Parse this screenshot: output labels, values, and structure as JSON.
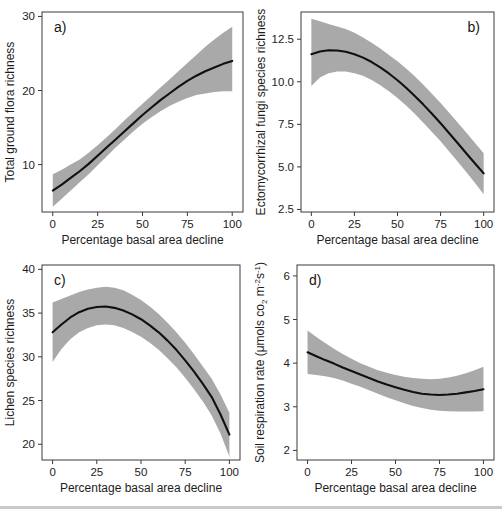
{
  "figure": {
    "background": "#ffffff",
    "band_color": "#a9a9a9",
    "line_color": "#101010",
    "axis_color": "#3a3a3a",
    "shared_xlabel": "Percentage basal area decline",
    "xticks": [
      "0",
      "25",
      "50",
      "75",
      "100"
    ]
  },
  "chart_data": [
    {
      "type": "line",
      "panel": "a",
      "tag": "a)",
      "title": "",
      "xlabel": "Percentage basal area decline",
      "ylabel": "Total ground flora richness",
      "xlim": [
        -6,
        106
      ],
      "ylim": [
        3.6,
        30.6
      ],
      "xticks": [
        0,
        25,
        50,
        75,
        100
      ],
      "xticklabels": [
        "0",
        "25",
        "50",
        "75",
        "100"
      ],
      "yticks": [
        10,
        20,
        30
      ],
      "yticklabels": [
        "10",
        "20",
        "30"
      ],
      "grid": false,
      "legend": "none",
      "x": [
        0,
        5,
        10,
        15,
        20,
        25,
        30,
        35,
        40,
        45,
        50,
        55,
        60,
        65,
        70,
        75,
        80,
        85,
        90,
        95,
        100
      ],
      "fit": [
        6.5,
        7.3,
        8.2,
        9.1,
        10.1,
        11.2,
        12.3,
        13.4,
        14.5,
        15.6,
        16.7,
        17.7,
        18.7,
        19.6,
        20.5,
        21.3,
        22.0,
        22.6,
        23.1,
        23.6,
        24.0
      ],
      "ci_lower": [
        4.3,
        5.4,
        6.5,
        7.6,
        8.7,
        9.9,
        11.1,
        12.3,
        13.4,
        14.5,
        15.5,
        16.4,
        17.2,
        17.9,
        18.5,
        19.0,
        19.4,
        19.6,
        19.8,
        19.9,
        19.9
      ],
      "ci_upper": [
        8.7,
        9.3,
        10.0,
        10.7,
        11.6,
        12.6,
        13.7,
        14.8,
        16.0,
        17.1,
        18.2,
        19.3,
        20.4,
        21.5,
        22.6,
        23.7,
        24.8,
        25.9,
        26.9,
        27.8,
        28.6
      ]
    },
    {
      "type": "line",
      "panel": "b",
      "tag": "b)",
      "title": "",
      "xlabel": "Percentage basal area decline",
      "ylabel": "Ectomycorrhizal fungi species richness",
      "xlim": [
        -6,
        106
      ],
      "ylim": [
        2.35,
        14.1
      ],
      "xticks": [
        0,
        25,
        50,
        75,
        100
      ],
      "xticklabels": [
        "0",
        "25",
        "50",
        "75",
        "100"
      ],
      "yticks": [
        2.5,
        5.0,
        7.5,
        10.0,
        12.5
      ],
      "yticklabels": [
        "2.5",
        "5.0",
        "7.5",
        "10.0",
        "12.5"
      ],
      "grid": false,
      "legend": "none",
      "x": [
        0,
        5,
        10,
        15,
        20,
        25,
        30,
        35,
        40,
        45,
        50,
        55,
        60,
        65,
        70,
        75,
        80,
        85,
        90,
        95,
        100
      ],
      "fit": [
        11.62,
        11.78,
        11.85,
        11.84,
        11.76,
        11.62,
        11.42,
        11.16,
        10.85,
        10.49,
        10.09,
        9.65,
        9.17,
        8.66,
        8.12,
        7.56,
        6.98,
        6.39,
        5.79,
        5.2,
        4.62
      ],
      "ci_lower": [
        9.75,
        10.25,
        10.5,
        10.6,
        10.6,
        10.5,
        10.35,
        10.1,
        9.8,
        9.45,
        9.05,
        8.6,
        8.12,
        7.6,
        7.05,
        6.5,
        5.9,
        5.3,
        4.68,
        4.05,
        3.4
      ],
      "ci_upper": [
        13.7,
        13.55,
        13.4,
        13.25,
        13.1,
        12.88,
        12.6,
        12.3,
        11.95,
        11.58,
        11.2,
        10.78,
        10.32,
        9.82,
        9.3,
        8.75,
        8.18,
        7.6,
        7.0,
        6.4,
        5.8
      ]
    },
    {
      "type": "line",
      "panel": "c",
      "tag": "c)",
      "title": "",
      "xlabel": "Percentage basal area decline",
      "ylabel": "Lichen species richness",
      "xlim": [
        -6,
        106
      ],
      "ylim": [
        18.2,
        40.5
      ],
      "xticks": [
        0,
        25,
        50,
        75,
        100
      ],
      "xticklabels": [
        "0",
        "25",
        "50",
        "75",
        "100"
      ],
      "yticks": [
        20,
        25,
        30,
        35,
        40
      ],
      "yticklabels": [
        "20",
        "25",
        "30",
        "35",
        "40"
      ],
      "grid": false,
      "legend": "none",
      "x": [
        0,
        5,
        10,
        15,
        20,
        25,
        30,
        35,
        40,
        45,
        50,
        55,
        60,
        65,
        70,
        75,
        80,
        85,
        90,
        95,
        100
      ],
      "fit": [
        32.8,
        33.7,
        34.5,
        35.1,
        35.5,
        35.7,
        35.75,
        35.6,
        35.3,
        34.85,
        34.3,
        33.6,
        32.8,
        31.85,
        30.8,
        29.6,
        28.3,
        26.9,
        25.4,
        23.4,
        21.1
      ],
      "ci_lower": [
        29.4,
        30.9,
        32.0,
        32.8,
        33.3,
        33.6,
        33.7,
        33.6,
        33.3,
        32.85,
        32.3,
        31.6,
        30.8,
        29.85,
        28.8,
        27.6,
        26.3,
        24.9,
        23.3,
        21.2,
        18.6
      ],
      "ci_upper": [
        36.2,
        36.6,
        37.0,
        37.4,
        37.7,
        37.9,
        38.0,
        37.9,
        37.6,
        37.1,
        36.5,
        35.75,
        34.9,
        33.9,
        32.8,
        31.6,
        30.3,
        28.9,
        27.5,
        25.7,
        23.6
      ]
    },
    {
      "type": "line",
      "panel": "d",
      "tag": "d)",
      "title": "",
      "xlabel": "Percentage basal area decline",
      "ylabel": "Soil respiration rate (μmols co2 m-2s-1)",
      "ylabel_parts": {
        "prefix": "Soil respiration rate (μmols co",
        "sub": "2",
        "mid": " m",
        "sup1": "-2",
        "mid2": "s",
        "sup2": "-1",
        "suffix": ")"
      },
      "xlim": [
        -6,
        106
      ],
      "ylim": [
        1.78,
        6.25
      ],
      "xticks": [
        0,
        25,
        50,
        75,
        100
      ],
      "xticklabels": [
        "0",
        "25",
        "50",
        "75",
        "100"
      ],
      "yticks": [
        2,
        3,
        4,
        5,
        6
      ],
      "yticklabels": [
        "2",
        "3",
        "4",
        "5",
        "6"
      ],
      "grid": false,
      "legend": "none",
      "x": [
        0,
        5,
        10,
        15,
        20,
        25,
        30,
        35,
        40,
        45,
        50,
        55,
        60,
        65,
        70,
        75,
        80,
        85,
        90,
        95,
        100
      ],
      "fit": [
        4.25,
        4.16,
        4.07,
        3.99,
        3.9,
        3.82,
        3.74,
        3.66,
        3.58,
        3.51,
        3.45,
        3.39,
        3.34,
        3.3,
        3.28,
        3.27,
        3.28,
        3.3,
        3.33,
        3.36,
        3.4
      ],
      "ci_lower": [
        3.75,
        3.73,
        3.7,
        3.66,
        3.6,
        3.53,
        3.46,
        3.38,
        3.3,
        3.22,
        3.15,
        3.08,
        3.02,
        2.97,
        2.93,
        2.91,
        2.9,
        2.89,
        2.89,
        2.89,
        2.9
      ],
      "ci_upper": [
        4.75,
        4.6,
        4.46,
        4.33,
        4.21,
        4.1,
        4.0,
        3.92,
        3.84,
        3.78,
        3.73,
        3.69,
        3.66,
        3.64,
        3.63,
        3.64,
        3.67,
        3.71,
        3.77,
        3.84,
        3.92
      ]
    }
  ]
}
